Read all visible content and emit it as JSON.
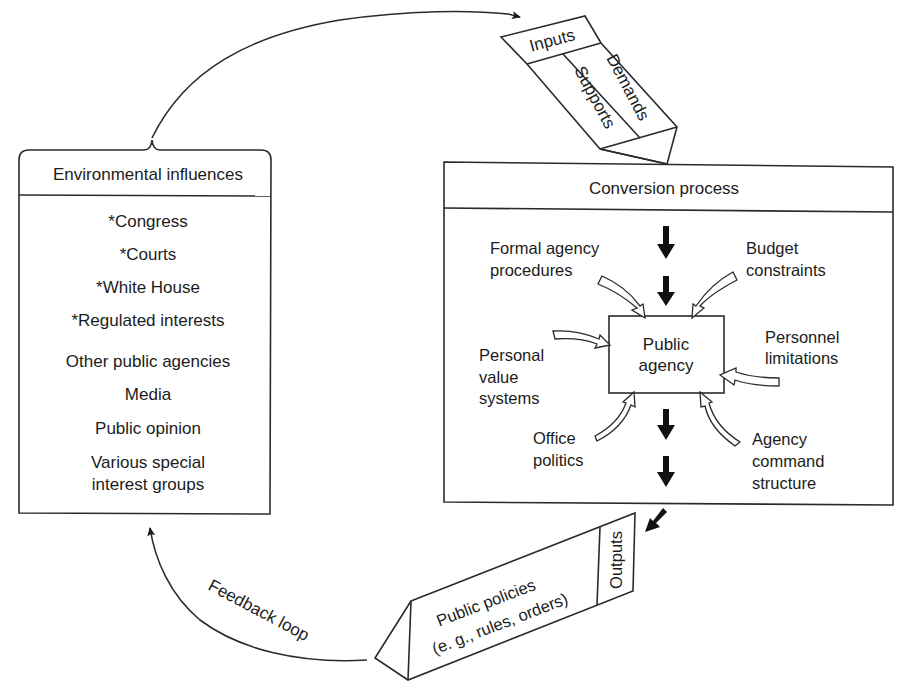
{
  "diagram": {
    "type": "systems-model",
    "environmental_influences": {
      "title": "Environmental influences",
      "items": [
        "*Congress",
        "*Courts",
        "*White House",
        "*Regulated interests",
        "Other public agencies",
        "Media",
        "Public opinion",
        "Various special",
        "interest groups"
      ]
    },
    "inputs": {
      "title": "Inputs",
      "left_label": "Supports",
      "right_label": "Demands"
    },
    "conversion_process": {
      "title": "Conversion process",
      "center": {
        "line1": "Public",
        "line2": "agency"
      },
      "influences": {
        "formal_agency_procedures": {
          "line1": "Formal agency",
          "line2": "procedures"
        },
        "budget_constraints": {
          "line1": "Budget",
          "line2": "constraints"
        },
        "personal_value_systems": {
          "line1": "Personal",
          "line2": "value",
          "line3": "systems"
        },
        "personnel_limitations": {
          "line1": "Personnel",
          "line2": "limitations"
        },
        "office_politics": {
          "line1": "Office",
          "line2": "politics"
        },
        "agency_command_structure": {
          "line1": "Agency",
          "line2": "command",
          "line3": "structure"
        }
      }
    },
    "outputs": {
      "title": "Outputs",
      "line1": "Public policies",
      "line2": "(e. g., rules, orders)"
    },
    "feedback": {
      "label": "Feedback loop"
    },
    "colors": {
      "ink": "#1c1c1c",
      "background": "#ffffff"
    }
  }
}
